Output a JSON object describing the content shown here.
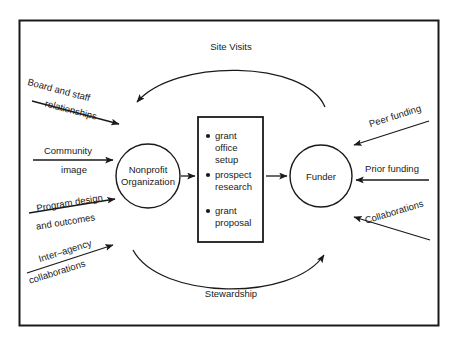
{
  "diagram": {
    "nodes": {
      "nonprofit": {
        "line1": "Nonprofit",
        "line2": "Organization"
      },
      "funder": {
        "label": "Funder"
      }
    },
    "process_box": {
      "bullets": [
        {
          "lines": [
            "grant",
            "office",
            "setup"
          ]
        },
        {
          "lines": [
            "prospect",
            "research"
          ]
        },
        {
          "lines": [
            "grant",
            "proposal"
          ]
        }
      ]
    },
    "arcs": {
      "top": {
        "label": "Site Visits"
      },
      "bottom": {
        "label": "Stewardship"
      }
    },
    "left_inputs": [
      {
        "line1": "Board and staff",
        "line2": "relationships"
      },
      {
        "line1": "Community",
        "line2": "image"
      },
      {
        "line1": "Program design",
        "line2": "and outcomes"
      },
      {
        "line1": "Inter–agency",
        "line2": "collaborations"
      }
    ],
    "right_inputs": [
      {
        "label": "Peer funding"
      },
      {
        "label": "Prior funding"
      },
      {
        "label": "Collaborations"
      }
    ],
    "colors": {
      "stroke": "#1a1a1a",
      "background": "#ffffff"
    }
  }
}
